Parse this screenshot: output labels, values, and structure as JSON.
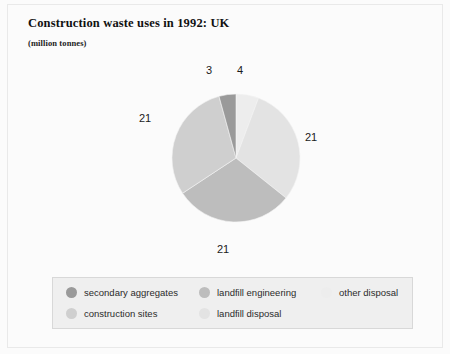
{
  "chart_data": {
    "type": "pie",
    "title": "Construction waste uses in 1992: UK",
    "subtitle": "(million tonnes)",
    "units": "million tonnes",
    "categories": [
      "secondary aggregates",
      "construction sites",
      "landfill engineering",
      "landfill disposal",
      "other disposal"
    ],
    "values": [
      3,
      21,
      21,
      21,
      4
    ],
    "total": 70,
    "labels_shown": [
      "3",
      "21",
      "21",
      "21",
      "4"
    ],
    "colors": [
      "#9a9a9a",
      "#cfcfcf",
      "#bdbdbd",
      "#e3e3e3",
      "#ededed"
    ],
    "legend_position": "bottom",
    "grid": false,
    "start_angle_deg": 0,
    "direction": "clockwise",
    "slices": [
      {
        "name": "other disposal",
        "value": 4,
        "label": "4",
        "color": "#ededed",
        "start_deg": 0,
        "end_deg": 20.6
      },
      {
        "name": "landfill disposal",
        "value": 21,
        "label": "21",
        "color": "#e3e3e3",
        "start_deg": 20.6,
        "end_deg": 128.6
      },
      {
        "name": "landfill engineering",
        "value": 21,
        "label": "21",
        "color": "#bdbdbd",
        "start_deg": 128.6,
        "end_deg": 236.6
      },
      {
        "name": "construction sites",
        "value": 21,
        "label": "21",
        "color": "#cfcfcf",
        "start_deg": 236.6,
        "end_deg": 344.6
      },
      {
        "name": "secondary aggregates",
        "value": 3,
        "label": "3",
        "color": "#9a9a9a",
        "start_deg": 344.6,
        "end_deg": 360
      }
    ]
  },
  "title": "Construction waste uses in 1992: UK",
  "subtitle": "(million tonnes)",
  "labels": {
    "top_left": "3",
    "top_right": "4",
    "right": "21",
    "bottom": "21",
    "left": "21"
  },
  "legend": {
    "items": [
      {
        "label": "secondary aggregates",
        "color": "#9a9a9a"
      },
      {
        "label": "landfill engineering",
        "color": "#bdbdbd"
      },
      {
        "label": "other disposal",
        "color": "#ededed"
      },
      {
        "label": "construction sites",
        "color": "#cfcfcf"
      },
      {
        "label": "landfill disposal",
        "color": "#e3e3e3"
      }
    ]
  }
}
